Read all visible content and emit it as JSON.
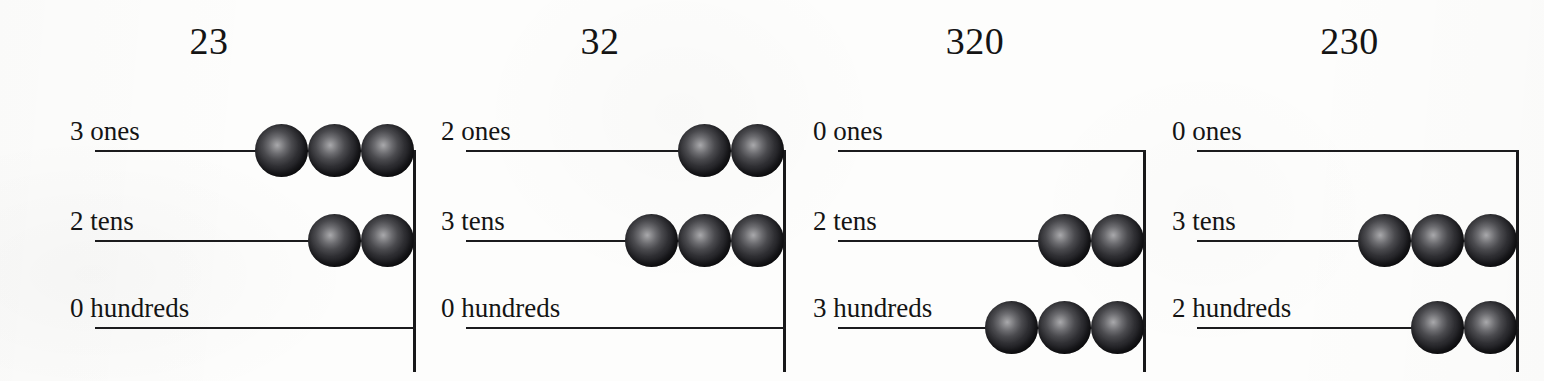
{
  "figure": {
    "type": "place-value-abacus-diagram",
    "background_color": "#fdfdfc",
    "ink_color": "#141414",
    "bead_color": "#2b2b2f",
    "panel_count": 4
  },
  "panels": [
    {
      "number": "23",
      "rods": [
        {
          "count_label": "3",
          "place_label": "ones",
          "label": "3 ones",
          "beads": 3
        },
        {
          "count_label": "2",
          "place_label": "tens",
          "label": "2 tens",
          "beads": 2
        },
        {
          "count_label": "0",
          "place_label": "hundreds",
          "label": "0 hundreds",
          "beads": 0
        }
      ]
    },
    {
      "number": "32",
      "rods": [
        {
          "count_label": "2",
          "place_label": "ones",
          "label": "2 ones",
          "beads": 2
        },
        {
          "count_label": "3",
          "place_label": "tens",
          "label": "3 tens",
          "beads": 3
        },
        {
          "count_label": "0",
          "place_label": "hundreds",
          "label": "0 hundreds",
          "beads": 0
        }
      ]
    },
    {
      "number": "320",
      "rods": [
        {
          "count_label": "0",
          "place_label": "ones",
          "label": "0 ones",
          "beads": 0
        },
        {
          "count_label": "2",
          "place_label": "tens",
          "label": "2 tens",
          "beads": 2
        },
        {
          "count_label": "3",
          "place_label": "hundreds",
          "label": "3 hundreds",
          "beads": 3
        }
      ]
    },
    {
      "number": "230",
      "rods": [
        {
          "count_label": "0",
          "place_label": "ones",
          "label": "0 ones",
          "beads": 0
        },
        {
          "count_label": "3",
          "place_label": "tens",
          "label": "3 tens",
          "beads": 3
        },
        {
          "count_label": "2",
          "place_label": "hundreds",
          "label": "2 hundreds",
          "beads": 2
        }
      ]
    }
  ],
  "layout": {
    "panel_x": [
      0,
      410,
      790,
      1155
    ],
    "panel_w": [
      418,
      380,
      370,
      389
    ],
    "post_x": [
      413,
      783,
      1143,
      1516
    ],
    "post_top": 150,
    "post_bottom": 372,
    "rod_y": [
      150,
      240,
      327
    ],
    "rod_left_x": [
      95,
      466,
      838,
      1197
    ],
    "bead_diameter": 53
  }
}
